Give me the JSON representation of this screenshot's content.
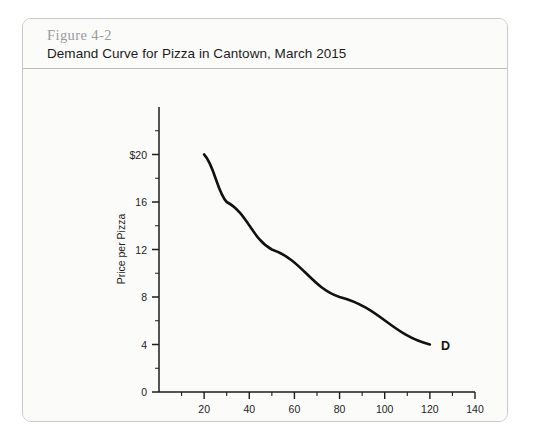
{
  "figure": {
    "number": "Figure 4-2",
    "title": "Demand Curve for Pizza in Cantown, March 2015"
  },
  "chart_data": {
    "type": "line",
    "title": "Demand Curve for Pizza in Cantown, March 2015",
    "xlabel": "Quantity (thousands per week)",
    "ylabel": "Price per Pizza",
    "xlim": [
      0,
      140
    ],
    "ylim": [
      0,
      24
    ],
    "grid": false,
    "legend": "none",
    "x_ticks": [
      "20",
      "40",
      "60",
      "80",
      "100",
      "120",
      "140"
    ],
    "x_tick_values": [
      20,
      40,
      60,
      80,
      100,
      120,
      140
    ],
    "x_minor_tick_values": [
      10,
      30,
      50,
      70,
      90,
      110,
      130
    ],
    "y_ticks": [
      "0",
      "4",
      "8",
      "12",
      "16",
      "$20"
    ],
    "y_tick_values": [
      0,
      4,
      8,
      12,
      16,
      20
    ],
    "y_minor_tick_values": [
      2,
      6,
      10,
      14,
      18,
      22
    ],
    "series": [
      {
        "name": "D",
        "label": "D",
        "color": "#111111",
        "x": [
          20,
          30,
          50,
          80,
          120
        ],
        "y": [
          20,
          16,
          12,
          8,
          4
        ]
      }
    ],
    "annotations": [
      {
        "text": "D",
        "x": 124,
        "y": 4
      }
    ]
  }
}
